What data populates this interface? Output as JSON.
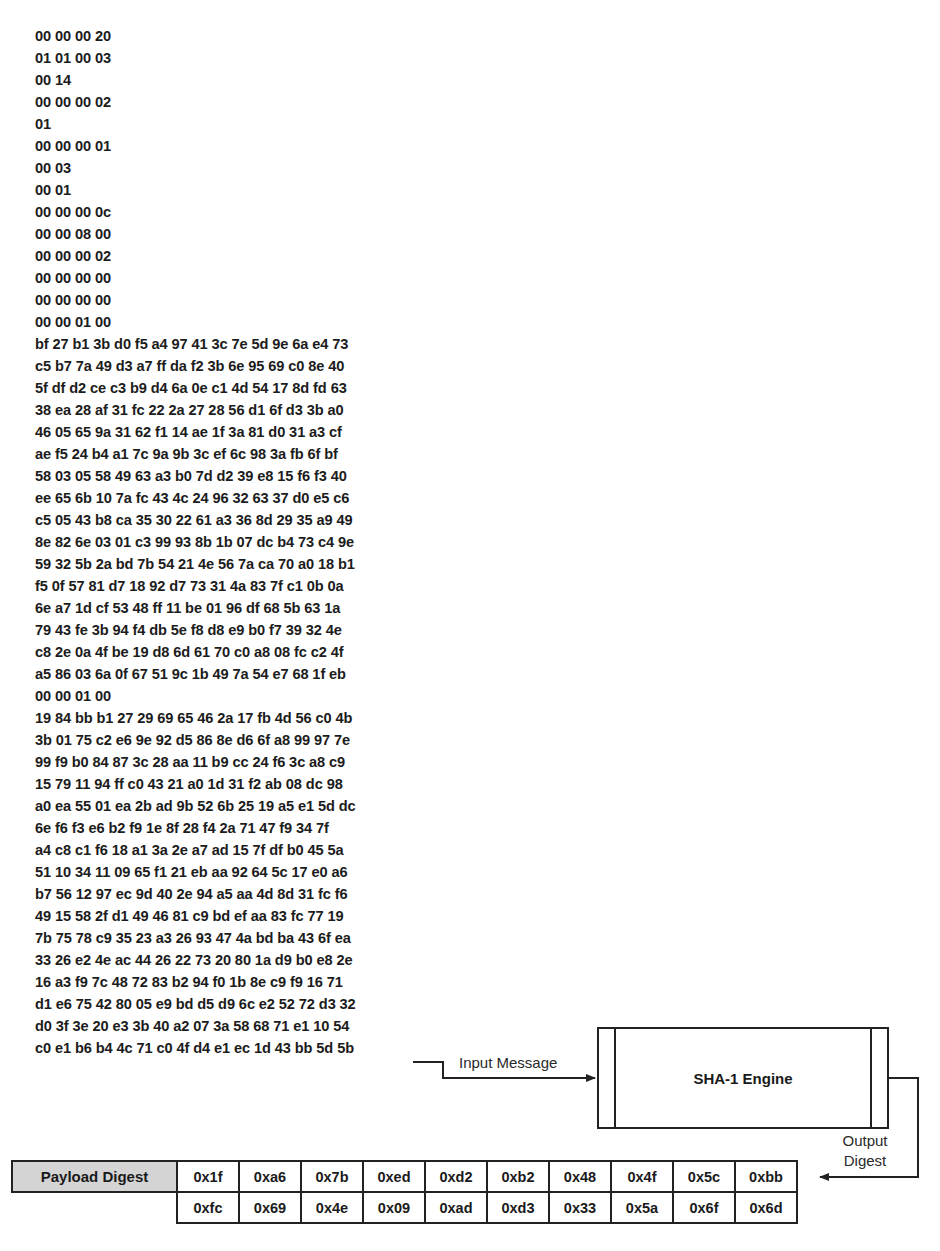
{
  "hex_dump": {
    "lines": [
      "00 00 00 20",
      "01 01 00 03",
      "00 14",
      "00 00 00 02",
      "01",
      "00 00 00 01",
      "00 03",
      "00 01",
      "00 00 00 0c",
      "00 00 08 00",
      "00 00 00 02",
      "00 00 00 00",
      "00 00 00 00",
      "00 00 01 00",
      "bf 27 b1 3b d0 f5 a4 97 41 3c 7e 5d 9e 6a e4 73",
      "c5 b7 7a 49 d3 a7 ff da f2 3b 6e 95 69 c0 8e 40",
      "5f df d2 ce c3 b9 d4 6a 0e c1 4d 54 17 8d fd 63",
      "38 ea 28 af 31 fc 22 2a 27 28 56 d1 6f d3 3b a0",
      "46 05 65 9a 31 62 f1 14 ae 1f 3a 81 d0 31 a3 cf",
      "ae f5 24 b4 a1 7c 9a 9b 3c ef 6c 98 3a fb 6f bf",
      "58 03 05 58 49 63 a3 b0 7d d2 39 e8 15 f6 f3 40",
      "ee 65 6b 10 7a fc 43 4c 24 96 32 63 37 d0 e5 c6",
      "c5 05 43 b8 ca 35 30 22 61 a3 36 8d 29 35 a9 49",
      "8e 82 6e 03 01 c3 99 93 8b 1b 07 dc b4 73 c4 9e",
      "59 32 5b 2a bd 7b 54 21 4e 56 7a ca 70 a0 18 b1",
      "f5 0f 57 81 d7 18 92 d7 73 31 4a 83 7f c1 0b 0a",
      "6e a7 1d cf 53 48 ff 11 be 01 96 df 68 5b 63 1a",
      "79 43 fe 3b 94 f4 db 5e f8 d8 e9 b0 f7 39 32 4e",
      "c8 2e 0a 4f be 19 d8 6d 61 70 c0 a8 08 fc c2 4f",
      "a5 86 03 6a 0f 67 51 9c 1b 49 7a 54 e7 68 1f eb",
      "00 00 01 00",
      "19 84 bb b1 27 29 69 65 46 2a 17 fb 4d 56 c0 4b",
      "3b 01 75 c2 e6 9e 92 d5 86 8e d6 6f a8 99 97 7e",
      "99 f9 b0 84 87 3c 28 aa 11 b9 cc 24 f6 3c a8 c9",
      "15 79 11 94 ff c0 43 21 a0 1d 31 f2 ab 08 dc 98",
      "a0 ea 55 01 ea 2b ad 9b 52 6b 25 19 a5 e1 5d dc",
      "6e f6 f3 e6 b2 f9 1e 8f 28 f4 2a 71 47 f9 34 7f",
      "a4 c8 c1 f6 18 a1 3a 2e a7 ad 15 7f df b0 45 5a",
      "51 10 34 11 09 65 f1 21 eb aa 92 64 5c 17 e0 a6",
      "b7 56 12 97 ec 9d 40 2e 94 a5 aa 4d 8d 31 fc f6",
      "49 15 58 2f d1 49 46 81 c9 bd ef aa 83 fc 77 19",
      "7b 75 78 c9 35 23 a3 26 93 47 4a bd ba 43 6f ea",
      "33 26 e2 4e ac 44 26 22 73 20 80 1a d9 b0 e8 2e",
      "16 a3 f9 7c 48 72 83 b2 94 f0 1b 8e c9 f9 16 71",
      "d1 e6 75 42 80 05 e9 bd d5 d9 6c e2 52 72 d3 32",
      "d0 3f 3e 20 e3 3b 40 a2 07 3a 58 68 71 e1 10 54",
      "c0 e1 b6 b4 4c 71 c0 4f d4 e1 ec 1d 43 bb 5d 5b"
    ]
  },
  "diagram": {
    "input_label": "Input Message",
    "engine_title": "SHA-1 Engine",
    "output_label_line1": "Output",
    "output_label_line2": "Digest",
    "arrow_icons": [
      "arrow-right-icon",
      "arrow-left-icon"
    ]
  },
  "digest_table": {
    "header": "Payload Digest",
    "header_bg": "#d4d4d4",
    "row1": [
      "0x1f",
      "0xa6",
      "0x7b",
      "0xed",
      "0xd2",
      "0xb2",
      "0x48",
      "0x4f",
      "0x5c",
      "0xbb"
    ],
    "row2": [
      "0xfc",
      "0x69",
      "0x4e",
      "0x09",
      "0xad",
      "0xd3",
      "0x33",
      "0x5a",
      "0x6f",
      "0x6d"
    ]
  }
}
